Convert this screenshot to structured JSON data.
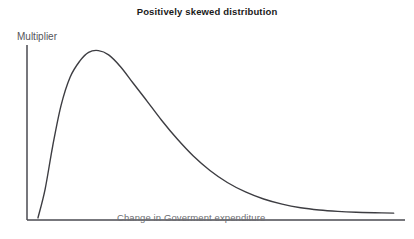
{
  "figure": {
    "background_color": "#ffffff",
    "width": 414,
    "height": 239
  },
  "chart_data": {
    "type": "line",
    "title": "Positively skewed distribution",
    "subtitle": "",
    "xlabel": "Change in Goverment expenditure",
    "ylabel": "Multiplier",
    "grid": false,
    "legend": null,
    "legend_position": "none",
    "xticks": [],
    "yticks": [],
    "xtick_labels": [],
    "ytick_labels": [],
    "xlim": [
      0,
      1
    ],
    "ylim": [
      0,
      1
    ],
    "series": [
      {
        "name": "Positively skewed multiplier curve",
        "color": "#3d3d42",
        "line_width": 1.4,
        "x": [
          0.029,
          0.048,
          0.068,
          0.09,
          0.114,
          0.14,
          0.163,
          0.189,
          0.216,
          0.248,
          0.281,
          0.318,
          0.356,
          0.397,
          0.44,
          0.484,
          0.53,
          0.578,
          0.626,
          0.675,
          0.724,
          0.773,
          0.822,
          0.871,
          0.92,
          0.97
        ],
        "y": [
          0.012,
          0.18,
          0.43,
          0.665,
          0.83,
          0.925,
          0.975,
          0.985,
          0.96,
          0.89,
          0.795,
          0.69,
          0.58,
          0.472,
          0.372,
          0.288,
          0.218,
          0.163,
          0.122,
          0.092,
          0.071,
          0.058,
          0.05,
          0.045,
          0.042,
          0.04
        ],
        "peak_x": 0.192,
        "peak_y": 0.985
      }
    ],
    "annotations": []
  },
  "axes": {
    "color": "#4a4a50",
    "line_width": 1.5,
    "x_axis": {
      "x_start": 27,
      "x_end": 405,
      "y": 220
    },
    "y_axis": {
      "x": 27,
      "y_start": 45,
      "y_end": 220
    }
  }
}
